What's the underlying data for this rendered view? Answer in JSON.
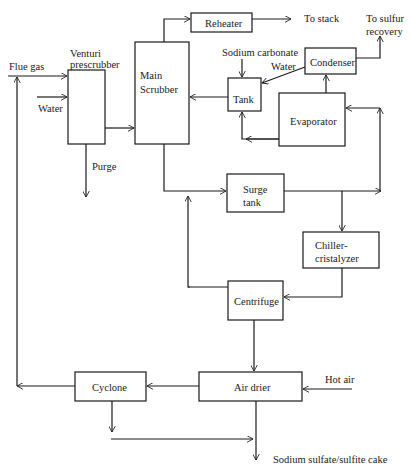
{
  "diagram": {
    "type": "process-flow",
    "units": {
      "venturi_prescrubber": [
        "Venturi",
        "prescrubber"
      ],
      "main_scrubber": [
        "Main",
        "Scrubber"
      ],
      "reheater": "Reheater",
      "tank": "Tank",
      "condenser": "Condenser",
      "evaporator": "Evaporator",
      "surge_tank": [
        "Surge",
        "tank"
      ],
      "chiller_cristalyzer": [
        "Chiller-",
        "cristalyzer"
      ],
      "centrifuge": "Centrifuge",
      "air_drier": "Air drier",
      "cyclone": "Cyclone"
    },
    "streams": {
      "flue_gas": "Flue gas",
      "water_in": "Water",
      "purge": "Purge",
      "to_stack": "To stack",
      "to_sulfur_recovery": [
        "To sulfur",
        "recovery"
      ],
      "sodium_carbonate": "Sodium carbonate",
      "water_condensate": "Water",
      "hot_air": "Hot air",
      "product": "Sodium sulfate/sulfite cake"
    },
    "edges": [
      {
        "from": "flue_gas",
        "to": "venturi_prescrubber"
      },
      {
        "from": "water_in",
        "to": "venturi_prescrubber"
      },
      {
        "from": "venturi_prescrubber",
        "to": "purge"
      },
      {
        "from": "venturi_prescrubber",
        "to": "main_scrubber"
      },
      {
        "from": "main_scrubber",
        "to": "reheater"
      },
      {
        "from": "reheater",
        "to": "to_stack"
      },
      {
        "from": "tank",
        "to": "main_scrubber"
      },
      {
        "from": "sodium_carbonate",
        "to": "tank"
      },
      {
        "from": "condenser",
        "to": "tank",
        "label": "Water"
      },
      {
        "from": "condenser",
        "to": "to_sulfur_recovery"
      },
      {
        "from": "evaporator",
        "to": "condenser"
      },
      {
        "from": "evaporator",
        "to": "tank"
      },
      {
        "from": "main_scrubber",
        "to": "surge_tank"
      },
      {
        "from": "surge_tank",
        "to": "evaporator"
      },
      {
        "from": "surge_tank",
        "to": "chiller_cristalyzer"
      },
      {
        "from": "chiller_cristalyzer",
        "to": "centrifuge"
      },
      {
        "from": "centrifuge",
        "to": "surge_tank"
      },
      {
        "from": "centrifuge",
        "to": "air_drier"
      },
      {
        "from": "hot_air",
        "to": "air_drier"
      },
      {
        "from": "air_drier",
        "to": "cyclone"
      },
      {
        "from": "cyclone",
        "to": "flue_gas"
      },
      {
        "from": "cyclone",
        "to": "product"
      },
      {
        "from": "air_drier",
        "to": "product"
      }
    ]
  }
}
